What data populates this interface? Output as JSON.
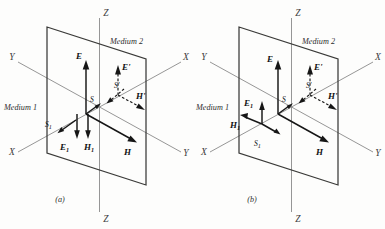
{
  "figure": {
    "caption_a": "(a)",
    "caption_b": "(b)",
    "medium_upper": "Medium 2",
    "medium_lower": "Medium 1"
  },
  "axes": {
    "z_top": "Z",
    "z_bottom": "Z",
    "x_right": "X",
    "x_left": "X",
    "y_left": "Y",
    "y_right": "Y"
  },
  "panel_a": {
    "label": "(a)",
    "medium2": "Medium 2",
    "medium1": "Medium 1",
    "axis_z_top": "Z",
    "axis_z_bottom": "Z",
    "axis_x_right": "X",
    "axis_x_left": "X",
    "axis_y_left": "Y",
    "axis_y_right": "Y",
    "vectors": {
      "E": "E",
      "H": "H",
      "S": "S",
      "E_inc": "E",
      "E_inc_sub": "1",
      "H_inc": "H",
      "H_inc_sub": "1",
      "S_inc": "S",
      "S_inc_sub": "1",
      "E_ref": "E'",
      "H_ref": "H'",
      "S_ref": "S'"
    }
  },
  "panel_b": {
    "label": "(b)",
    "medium2": "Medium 2",
    "medium1": "Medium 1",
    "axis_z_top": "Z",
    "axis_z_bottom": "Z",
    "axis_x_right": "X",
    "axis_x_left": "X",
    "axis_y_left": "Y",
    "axis_y_right": "Y",
    "vectors": {
      "E": "E",
      "H": "H",
      "S": "S",
      "E_inc": "E",
      "E_inc_sub": "1",
      "H_inc": "H",
      "H_inc_sub": "1",
      "S_inc": "S",
      "S_inc_sub": "1",
      "E_ref": "E'",
      "H_ref": "H'",
      "S_ref": "S'"
    }
  },
  "colors": {
    "axis": "#8a8a8a",
    "plane_edge": "#3a3a38",
    "vector": "#161616",
    "background": "#fdfdfc"
  }
}
